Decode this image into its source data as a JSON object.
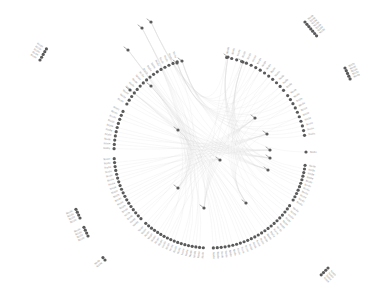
{
  "diagram": {
    "type": "radial-dendrogram",
    "center": [
      210,
      152
    ],
    "ring_radius": 96,
    "colors": {
      "node": "#5a5a5a",
      "label": "#9a9a9a",
      "link": "#d6d6d6",
      "background": "#ffffff"
    },
    "ring_groups": [
      {
        "start_deg": -80,
        "end_deg": -40,
        "count": 14
      },
      {
        "start_deg": -36,
        "end_deg": -10,
        "count": 10
      },
      {
        "start_deg": -4,
        "end_deg": 4,
        "count": 1
      },
      {
        "start_deg": 8,
        "end_deg": 30,
        "count": 11
      },
      {
        "start_deg": 34,
        "end_deg": 88,
        "count": 24
      },
      {
        "start_deg": 94,
        "end_deg": 132,
        "count": 18
      },
      {
        "start_deg": 136,
        "end_deg": 176,
        "count": 18
      },
      {
        "start_deg": 182,
        "end_deg": 205,
        "count": 10
      },
      {
        "start_deg": 210,
        "end_deg": 250,
        "count": 16
      }
    ],
    "outer_clusters": [
      {
        "x": 40,
        "y": 60,
        "count": 5,
        "angle": -150,
        "spacing": 3.2
      },
      {
        "x": 305,
        "y": 22,
        "count": 7,
        "angle": -40,
        "spacing": 3.0
      },
      {
        "x": 345,
        "y": 68,
        "count": 5,
        "angle": -25,
        "spacing": 3.0
      },
      {
        "x": 80,
        "y": 218,
        "count": 4,
        "angle": 155,
        "spacing": 3.2
      },
      {
        "x": 88,
        "y": 236,
        "count": 4,
        "angle": 155,
        "spacing": 3.2
      },
      {
        "x": 105,
        "y": 260,
        "count": 2,
        "angle": 140,
        "spacing": 3.2
      },
      {
        "x": 328,
        "y": 268,
        "count": 4,
        "angle": 45,
        "spacing": 3.2
      }
    ],
    "inner_nodes": [
      {
        "x": 151,
        "y": 22,
        "label": "node"
      },
      {
        "x": 177,
        "y": 63,
        "label": "node"
      },
      {
        "x": 182,
        "y": 61,
        "label": "node"
      },
      {
        "x": 228,
        "y": 57,
        "label": "node"
      },
      {
        "x": 243,
        "y": 62,
        "label": "node"
      },
      {
        "x": 130,
        "y": 90,
        "label": "node"
      },
      {
        "x": 151,
        "y": 86,
        "label": "node"
      },
      {
        "x": 128,
        "y": 50,
        "label": "node"
      },
      {
        "x": 142,
        "y": 28,
        "label": "node"
      },
      {
        "x": 178,
        "y": 130,
        "label": "node"
      },
      {
        "x": 220,
        "y": 160,
        "label": "node"
      },
      {
        "x": 255,
        "y": 118,
        "label": "node"
      },
      {
        "x": 267,
        "y": 134,
        "label": "node"
      },
      {
        "x": 270,
        "y": 150,
        "label": "node"
      },
      {
        "x": 270,
        "y": 158,
        "label": "node"
      },
      {
        "x": 268,
        "y": 170,
        "label": "node"
      },
      {
        "x": 178,
        "y": 188,
        "label": "node"
      },
      {
        "x": 204,
        "y": 208,
        "label": "node"
      },
      {
        "x": 246,
        "y": 203,
        "label": "node"
      }
    ],
    "label_text": "Node"
  }
}
